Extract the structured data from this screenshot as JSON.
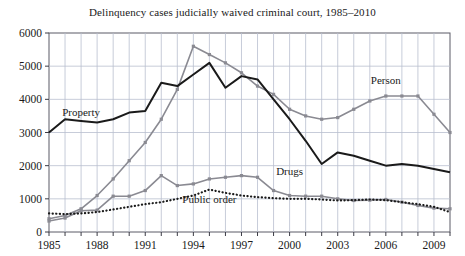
{
  "chart_data": {
    "type": "line",
    "title": "Delinquency cases judicially waived criminal court, 1985–2010",
    "xlabel": "",
    "ylabel": "",
    "xlim": [
      1985,
      2010
    ],
    "ylim": [
      0,
      6000
    ],
    "grid": true,
    "legend_position": "inline-annotations",
    "x": [
      1985,
      1986,
      1987,
      1988,
      1989,
      1990,
      1991,
      1992,
      1993,
      1994,
      1995,
      1996,
      1997,
      1998,
      1999,
      2000,
      2001,
      2002,
      2003,
      2004,
      2005,
      2006,
      2007,
      2008,
      2009,
      2010
    ],
    "xticks": [
      1985,
      1988,
      1991,
      1994,
      1997,
      2000,
      2003,
      2006,
      2009
    ],
    "xticklabels": [
      "1985",
      "1988",
      "1991",
      "1994",
      "1997",
      "2000",
      "2003",
      "2006",
      "2009"
    ],
    "yticks": [
      0,
      1000,
      2000,
      3000,
      4000,
      5000,
      6000
    ],
    "yticklabels": [
      "0",
      "1000",
      "2000",
      "3000",
      "4000",
      "5000",
      "6000"
    ],
    "series": [
      {
        "name": "Person",
        "color": "#8a8a92",
        "style": "solid-markers",
        "label_text": "Person",
        "label_x": 2006,
        "label_y": 4450,
        "values": [
          400,
          500,
          700,
          1100,
          1600,
          2150,
          2700,
          3400,
          4300,
          5600,
          5350,
          5100,
          4800,
          4400,
          4150,
          3700,
          3500,
          3400,
          3450,
          3700,
          3950,
          4100,
          4100,
          4100,
          3550,
          3000
        ]
      },
      {
        "name": "Property",
        "color": "#1a1a1a",
        "style": "solid",
        "label_text": "Property",
        "label_x": 1987,
        "label_y": 3500,
        "values": [
          3000,
          3400,
          3350,
          3300,
          3400,
          3600,
          3650,
          4500,
          4400,
          4750,
          5100,
          4350,
          4700,
          4600,
          4000,
          3400,
          2750,
          2050,
          2400,
          2300,
          2150,
          2000,
          2050,
          2000,
          1900,
          1800
        ]
      },
      {
        "name": "Drugs",
        "color": "#8a8a92",
        "style": "solid-markers",
        "label_text": "Drugs",
        "label_x": 2000,
        "label_y": 1720,
        "values": [
          330,
          420,
          640,
          660,
          1080,
          1080,
          1250,
          1700,
          1400,
          1450,
          1600,
          1650,
          1700,
          1650,
          1250,
          1100,
          1080,
          1080,
          1000,
          950,
          960,
          980,
          900,
          800,
          720,
          700
        ]
      },
      {
        "name": "Public order",
        "color": "#1a1a1a",
        "style": "dotted",
        "label_text": "Public order",
        "label_x": 1995,
        "label_y": 870,
        "values": [
          560,
          540,
          560,
          600,
          680,
          760,
          840,
          900,
          1000,
          1100,
          1280,
          1180,
          1100,
          1050,
          1020,
          1000,
          1000,
          980,
          950,
          960,
          980,
          960,
          900,
          840,
          760,
          600
        ]
      }
    ]
  }
}
